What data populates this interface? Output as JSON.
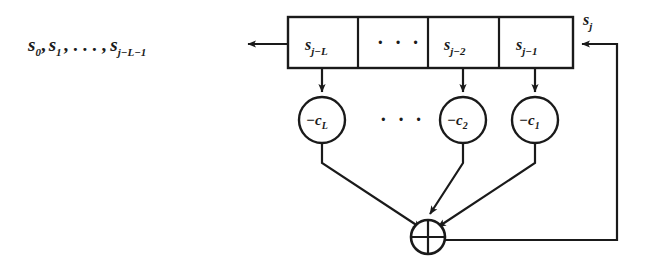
{
  "figure": {
    "type": "lfsr-block-diagram",
    "background_color": "#ffffff",
    "line_color": "#1a1a1a"
  },
  "output": {
    "label": "s",
    "terms": [
      {
        "base": "s",
        "sub": "0"
      },
      {
        "base": "s",
        "sub": "1"
      },
      {
        "base": "s",
        "sub": "j−L−1"
      }
    ],
    "full_text": "s0, s1, . . . , sj−L−1",
    "text_head": "s",
    "sub_0": "0",
    "sep_1": ",",
    "text_s1": "s",
    "sub_1": "1",
    "sep_2": ", . . . ,",
    "text_sn": "s",
    "sub_n": "j−L−1",
    "arrow_direction": "left"
  },
  "shift_register": {
    "cells": [
      {
        "base": "s",
        "sub": "j−L",
        "text": "sj−L",
        "has_tap": true
      },
      {
        "base": "",
        "sub": "",
        "text": "· · ·",
        "has_tap": false
      },
      {
        "base": "s",
        "sub": "j−2",
        "text": "sj−2",
        "has_tap": true
      },
      {
        "base": "s",
        "sub": "j−1",
        "text": "sj−1",
        "has_tap": true
      }
    ],
    "ellipsis": "· · ·"
  },
  "input": {
    "base": "s",
    "sub": "j",
    "text": "sj",
    "arrow_direction": "left"
  },
  "multipliers": [
    {
      "base": "−c",
      "sub": "L",
      "text": "−cL"
    },
    {
      "base": "−c",
      "sub": "2",
      "text": "−c2"
    },
    {
      "base": "−c",
      "sub": "1",
      "text": "−c1"
    }
  ],
  "multiplier_ellipsis": "· · ·",
  "adder": {
    "symbol": "⊕",
    "name": "xor-adder"
  }
}
